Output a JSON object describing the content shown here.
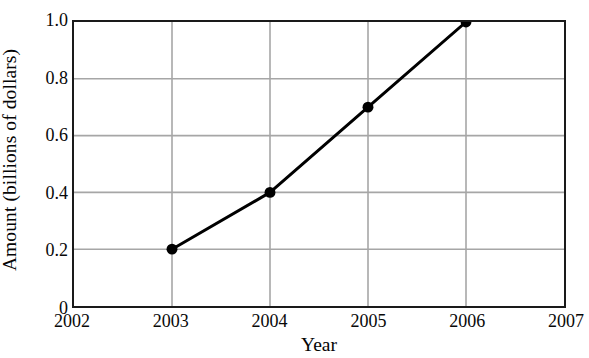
{
  "chart_data": {
    "type": "line",
    "title": "",
    "xlabel": "Year",
    "ylabel": "Amount (billions of dollars)",
    "x": [
      2003,
      2004,
      2005,
      2006
    ],
    "values": [
      0.2,
      0.4,
      0.7,
      1.0
    ],
    "series": [
      {
        "name": "Amount",
        "x": [
          2003,
          2004,
          2005,
          2006
        ],
        "values": [
          0.2,
          0.4,
          0.7,
          1.0
        ]
      }
    ],
    "xlim": [
      2002,
      2007
    ],
    "ylim": [
      0,
      1.0
    ],
    "x_ticks": [
      2002,
      2003,
      2004,
      2005,
      2006,
      2007
    ],
    "x_tick_labels": [
      "2002",
      "2003",
      "2004",
      "2005",
      "2006",
      "2007"
    ],
    "y_ticks": [
      0,
      0.2,
      0.4,
      0.6,
      0.8,
      1.0
    ],
    "y_tick_labels": [
      "0",
      "0.2",
      "0.4",
      "0.6",
      "0.8",
      "1.0"
    ],
    "grid": true,
    "grid_axes": "both",
    "legend": false,
    "legend_position": "none",
    "marker": "filled-circle",
    "marker_size": 11,
    "line_width": 3,
    "colors": {
      "line": "#000000",
      "marker": "#000000",
      "grid": "#a6a6a6",
      "axis": "#1a1a1a",
      "text": "#050505",
      "background": "#ffffff"
    }
  }
}
